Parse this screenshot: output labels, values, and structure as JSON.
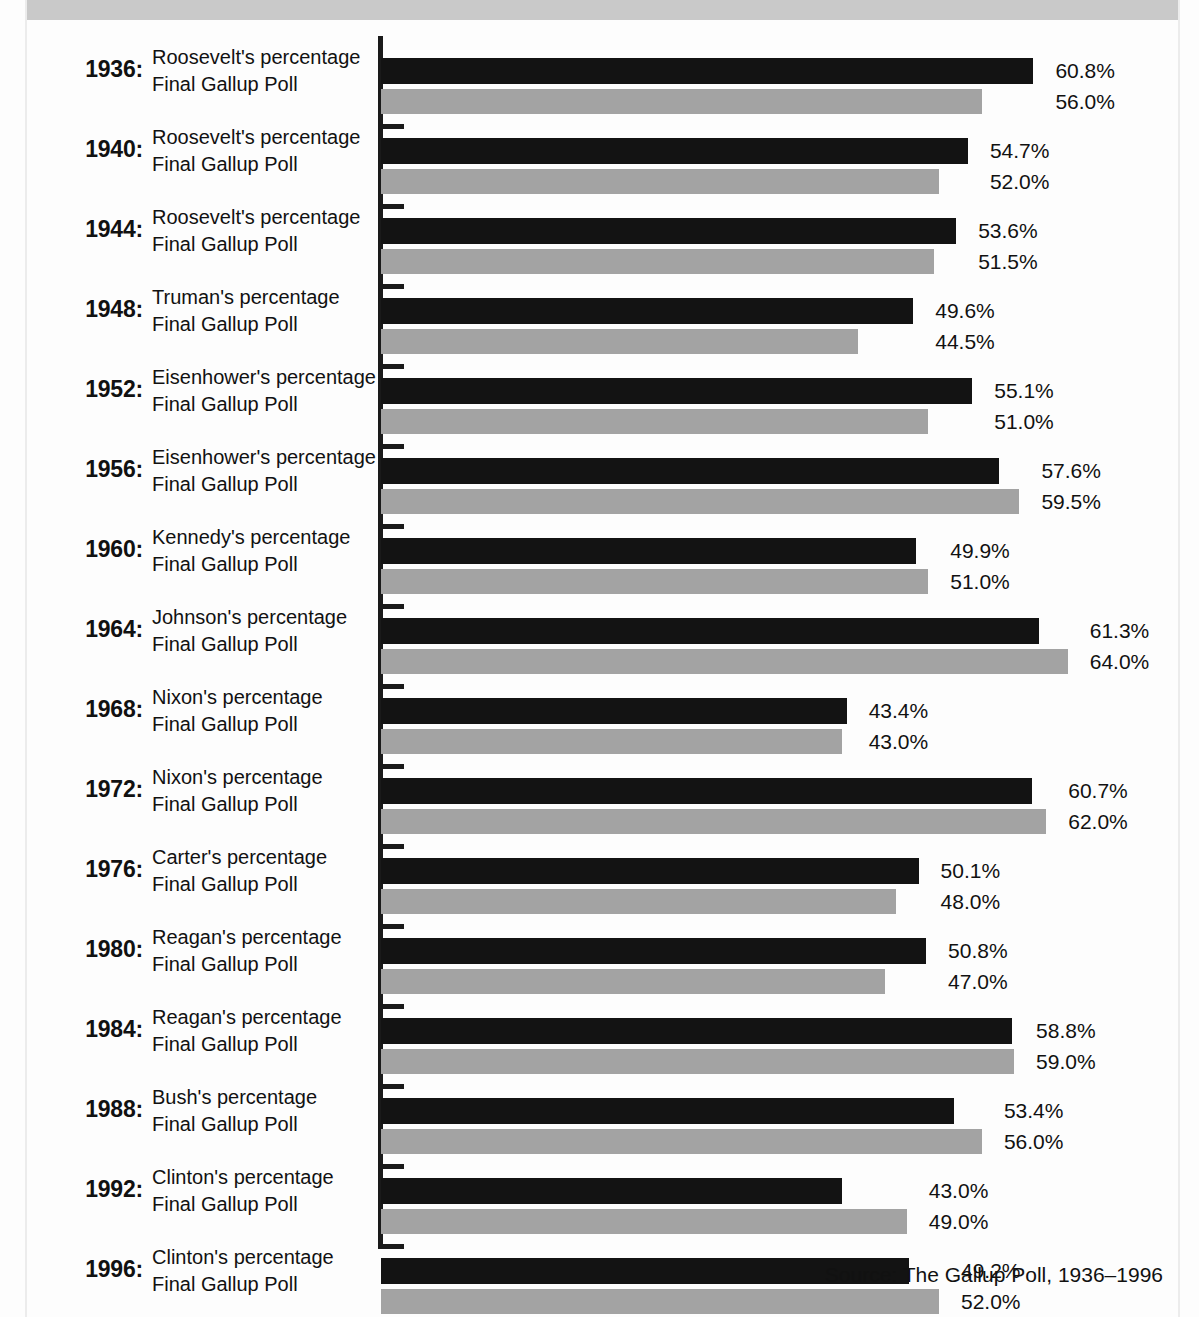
{
  "chart_data": {
    "type": "bar",
    "orientation": "horizontal",
    "title": "",
    "subtitle": "",
    "xlabel": "",
    "ylabel": "",
    "grid": false,
    "legend_position": "inline-row-labels",
    "xlim": [
      0,
      70
    ],
    "axis_scale_px_per_percent": 10.73,
    "value_suffix": "%",
    "categories": [
      "1936:",
      "1940:",
      "1944:",
      "1948:",
      "1952:",
      "1956:",
      "1960:",
      "1964:",
      "1968:",
      "1972:",
      "1976:",
      "1980:",
      "1984:",
      "1988:",
      "1992:",
      "1996:"
    ],
    "series": [
      {
        "name": "Candidate's percentage",
        "color": "#131313",
        "labels": [
          "Roosevelt's percentage",
          "Roosevelt's percentage",
          "Roosevelt's percentage",
          "Truman's percentage",
          "Eisenhower's percentage",
          "Eisenhower's percentage",
          "Kennedy's percentage",
          "Johnson's percentage",
          "Nixon's percentage",
          "Nixon's percentage",
          "Carter's percentage",
          "Reagan's percentage",
          "Reagan's percentage",
          "Bush's percentage",
          "Clinton's percentage",
          "Clinton's percentage"
        ],
        "values": [
          60.8,
          54.7,
          53.6,
          49.6,
          55.1,
          57.6,
          49.9,
          61.3,
          43.4,
          60.7,
          50.1,
          50.8,
          58.8,
          53.4,
          43.0,
          49.2
        ],
        "value_labels": [
          "60.8%",
          "54.7%",
          "53.6%",
          "49.6%",
          "55.1%",
          "57.6%",
          "49.9%",
          "61.3%",
          "43.4%",
          "60.7%",
          "50.1%",
          "50.8%",
          "58.8%",
          "53.4%",
          "43.0%",
          "49.2%"
        ]
      },
      {
        "name": "Final Gallup Poll",
        "color": "#a3a3a3",
        "labels": [
          "Final Gallup Poll",
          "Final Gallup Poll",
          "Final Gallup Poll",
          "Final Gallup Poll",
          "Final Gallup Poll",
          "Final Gallup Poll",
          "Final Gallup Poll",
          "Final Gallup Poll",
          "Final Gallup Poll",
          "Final Gallup Poll",
          "Final Gallup Poll",
          "Final Gallup Poll",
          "Final Gallup Poll",
          "Final Gallup Poll",
          "Final Gallup Poll",
          "Final Gallup Poll"
        ],
        "values": [
          56.0,
          52.0,
          51.5,
          44.5,
          51.0,
          59.5,
          51.0,
          64.0,
          43.0,
          62.0,
          48.0,
          47.0,
          59.0,
          56.0,
          49.0,
          52.0
        ],
        "value_labels": [
          "56.0%",
          "52.0%",
          "51.5%",
          "44.5%",
          "51.0%",
          "59.5%",
          "51.0%",
          "64.0%",
          "43.0%",
          "62.0%",
          "48.0%",
          "47.0%",
          "59.0%",
          "56.0%",
          "49.0%",
          "52.0%"
        ]
      }
    ]
  },
  "footer": {
    "source": "Source:  The Gallup Poll, 1936–1996"
  }
}
